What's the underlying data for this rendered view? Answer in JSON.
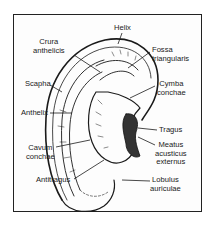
{
  "diagram": {
    "labels": {
      "helix": "Helix",
      "crura_anthelicis": "Crura\nanthelicis",
      "fossa_triangularis": "Fossa\ntriangularis",
      "scapha": "Scapha",
      "cymba_conchae": "Cymba\nconchae",
      "anthelix": "Anthelix",
      "tragus": "Tragus",
      "cavum_conchae": "Cavum\nconchae",
      "meatus_acusticus_externus": "Meatus\nacusticus\nexternus",
      "antitragus": "Antitragus",
      "lobulus_auriculae": "Lobulus\nauriculae"
    },
    "colors": {
      "line": "#1a1a1a",
      "background": "#ffffff"
    }
  }
}
